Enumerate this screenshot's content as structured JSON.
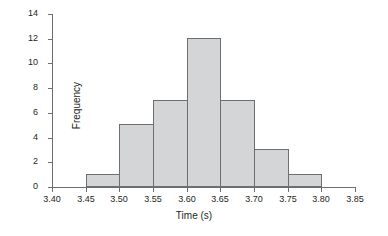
{
  "chart_data": {
    "type": "bar",
    "title": "",
    "subtitle": "",
    "xlabel": "Time (s)",
    "ylabel": "Frequency",
    "xlim": [
      3.4,
      3.85
    ],
    "ylim": [
      0,
      14
    ],
    "grid": false,
    "legend": null,
    "bin_width": 0.05,
    "categories": [
      "3.45-3.50",
      "3.50-3.55",
      "3.55-3.60",
      "3.60-3.65",
      "3.65-3.70",
      "3.70-3.75",
      "3.75-3.80"
    ],
    "bin_edges": [
      3.45,
      3.5,
      3.55,
      3.6,
      3.65,
      3.7,
      3.75,
      3.8
    ],
    "values": [
      1,
      5,
      7,
      12,
      7,
      3,
      1
    ],
    "bars": [
      {
        "left": 3.45,
        "right": 3.5,
        "value": 1
      },
      {
        "left": 3.5,
        "right": 3.55,
        "value": 5
      },
      {
        "left": 3.55,
        "right": 3.6,
        "value": 7
      },
      {
        "left": 3.6,
        "right": 3.65,
        "value": 12
      },
      {
        "left": 3.65,
        "right": 3.7,
        "value": 7
      },
      {
        "left": 3.7,
        "right": 3.75,
        "value": 3
      },
      {
        "left": 3.75,
        "right": 3.8,
        "value": 1
      }
    ],
    "x_ticks": [
      {
        "value": 3.4,
        "label": "3.40"
      },
      {
        "value": 3.45,
        "label": "3.45"
      },
      {
        "value": 3.5,
        "label": "3.50"
      },
      {
        "value": 3.55,
        "label": "3.55"
      },
      {
        "value": 3.6,
        "label": "3.60"
      },
      {
        "value": 3.65,
        "label": "3.65"
      },
      {
        "value": 3.7,
        "label": "3.70"
      },
      {
        "value": 3.75,
        "label": "3.75"
      },
      {
        "value": 3.8,
        "label": "3.80"
      },
      {
        "value": 3.85,
        "label": "3.85"
      }
    ],
    "y_ticks": [
      {
        "value": 0,
        "label": "0"
      },
      {
        "value": 2,
        "label": "2"
      },
      {
        "value": 4,
        "label": "4"
      },
      {
        "value": 6,
        "label": "6"
      },
      {
        "value": 8,
        "label": "8"
      },
      {
        "value": 10,
        "label": "10"
      },
      {
        "value": 12,
        "label": "12"
      },
      {
        "value": 14,
        "label": "14"
      }
    ],
    "colors": {
      "bar_fill": "#d4d5d6",
      "bar_edge": "#6d6e70",
      "axis": "#6d6e70",
      "text": "#231f20",
      "background": "#ffffff"
    }
  }
}
